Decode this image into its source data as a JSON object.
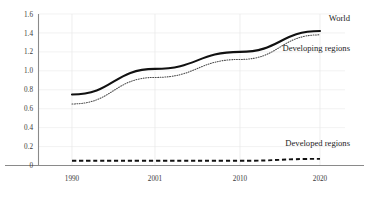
{
  "chart_data": {
    "type": "line",
    "title": "",
    "subtitle": "",
    "xlabel": "",
    "ylabel": "",
    "x": [
      1990,
      2001,
      2010,
      2020
    ],
    "xtick_labels": [
      "1990",
      "2001",
      "2010",
      "2020"
    ],
    "ytick_labels": [
      "0",
      "0.2",
      "0.4",
      "0.6",
      "0.8",
      "1.0",
      "1.2",
      "1.4",
      "1.6"
    ],
    "ytick_values": [
      0,
      0.2,
      0.4,
      0.6,
      0.8,
      1.0,
      1.2,
      1.4,
      1.6
    ],
    "ylim": [
      0,
      1.6
    ],
    "xlim": [
      1990,
      2020
    ],
    "grid": "both",
    "legend_position": "inline-annotations",
    "series": [
      {
        "name": "World",
        "style": "solid",
        "color": "#111111",
        "values": [
          0.75,
          1.02,
          1.2,
          1.42
        ]
      },
      {
        "name": "Developing regions",
        "style": "dotted",
        "color": "#4a4a4a",
        "values": [
          0.65,
          0.93,
          1.12,
          1.38
        ]
      },
      {
        "name": "Developed regions",
        "style": "dashed",
        "color": "#111111",
        "values": [
          0.05,
          0.05,
          0.05,
          0.07
        ]
      }
    ],
    "annotations": [
      {
        "text": "World",
        "x": 2018,
        "y": 1.53
      },
      {
        "text": "Developing regions",
        "x": 2018,
        "y": 1.21
      },
      {
        "text": "Developed regions",
        "x": 2018,
        "y": 0.21
      }
    ]
  }
}
